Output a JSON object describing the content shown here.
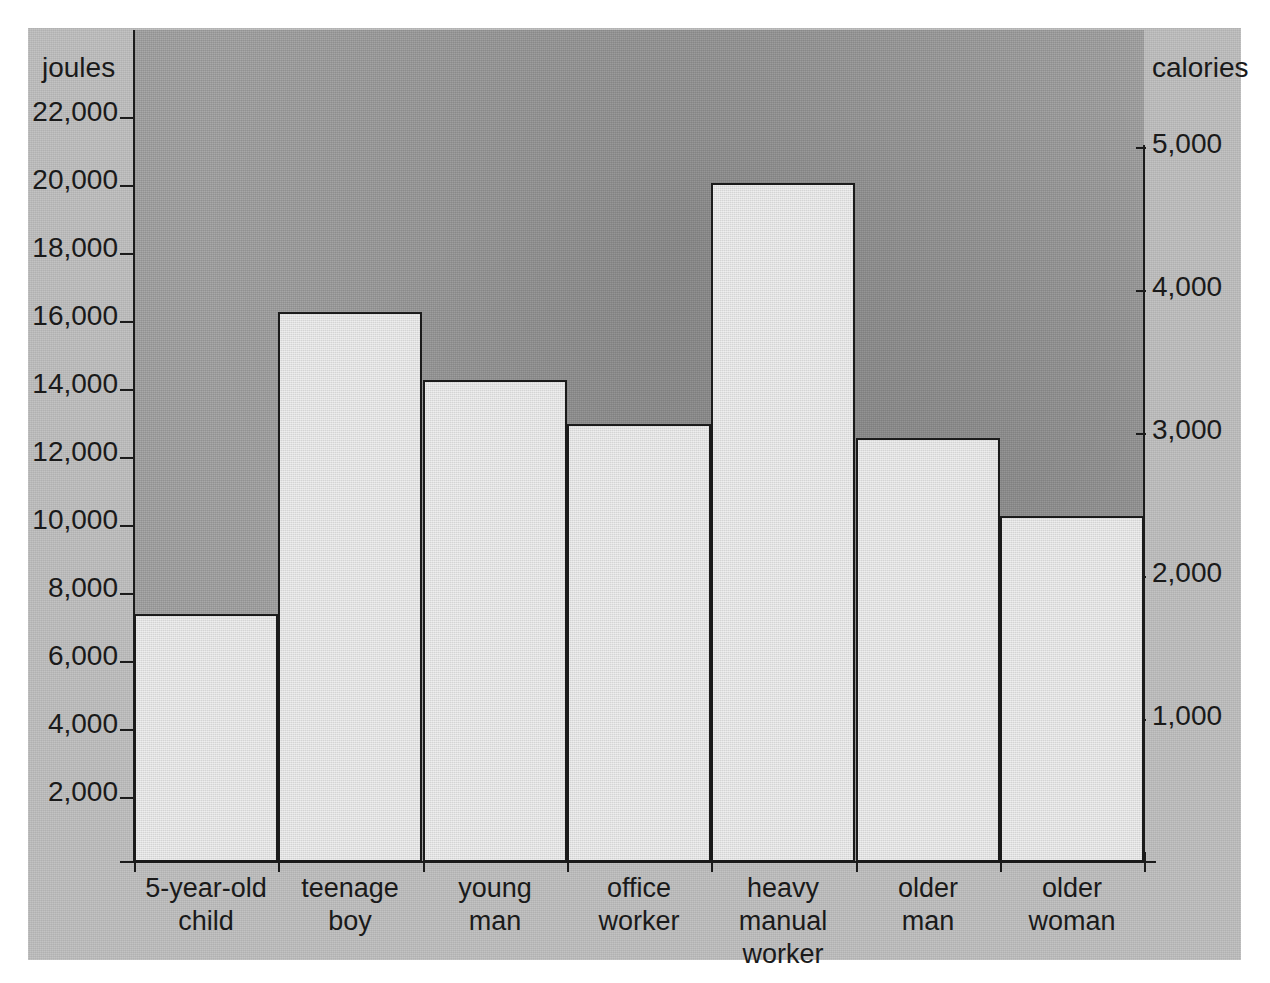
{
  "chart_data": {
    "type": "bar",
    "title": "",
    "categories": [
      "5-year-old child",
      "teenage boy",
      "young man",
      "office worker",
      "heavy manual worker",
      "older man",
      "older woman"
    ],
    "categories_lines": [
      [
        "5-year-old",
        "child"
      ],
      [
        "teenage",
        "boy"
      ],
      [
        "young",
        "man"
      ],
      [
        "office",
        "worker"
      ],
      [
        "heavy",
        "manual",
        "worker"
      ],
      [
        "older",
        "man"
      ],
      [
        "older",
        "woman"
      ]
    ],
    "values": [
      7400,
      16300,
      14300,
      13000,
      20100,
      12600,
      10300
    ],
    "values_calories": [
      1760,
      3890,
      3410,
      3100,
      4800,
      3000,
      2460
    ],
    "xlabel": "",
    "ylabel": "joules",
    "y2label": "calories",
    "ylim": [
      0,
      23000
    ],
    "y2lim": [
      0,
      5480
    ],
    "yticks": [
      2000,
      4000,
      6000,
      8000,
      10000,
      12000,
      14000,
      16000,
      18000,
      20000,
      22000
    ],
    "ytick_labels": [
      "2,000",
      "4,000",
      "6,000",
      "8,000",
      "10,000",
      "12,000",
      "14,000",
      "16,000",
      "18,000",
      "20,000",
      "22,000"
    ],
    "y2ticks": [
      1000,
      2000,
      3000,
      4000,
      5000
    ],
    "y2tick_labels": [
      "1,000",
      "2,000",
      "3,000",
      "4,000",
      "5,000"
    ],
    "grid": false,
    "legend": "none",
    "bar_fill_color": "#dcdcdc",
    "bar_edge_color": "#1b1b1b",
    "plot_bg_color": "#a0a0a0",
    "page_bg_color": "#bdbdbd"
  },
  "axes": {
    "left_title": "joules",
    "right_title": "calories"
  }
}
